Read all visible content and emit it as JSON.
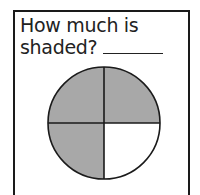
{
  "question": {
    "line1": "How much is",
    "line2": "shaded?"
  },
  "figure": {
    "shape": "circle",
    "parts": 4,
    "shaded_parts": 3,
    "shaded_quadrants": [
      "top-left",
      "top-right",
      "bottom-left"
    ],
    "shade_color": "#a8a8a8",
    "unshaded_color": "#ffffff"
  }
}
